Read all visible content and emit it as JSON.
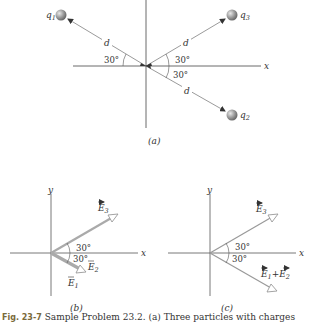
{
  "figure": {
    "panel_a": {
      "label": "(a)",
      "axis_x": "x",
      "charges": [
        {
          "name": "q",
          "sub": "1"
        },
        {
          "name": "q",
          "sub": "2"
        },
        {
          "name": "q",
          "sub": "3"
        }
      ],
      "distance_label": "d",
      "angles": [
        "30°",
        "30°",
        "30°"
      ]
    },
    "panel_b": {
      "label": "(b)",
      "axis_x": "x",
      "axis_y": "y",
      "vectors": [
        {
          "name": "E",
          "sub": "3"
        },
        {
          "name": "E",
          "sub": "2"
        },
        {
          "name": "E",
          "sub": "1"
        }
      ],
      "angles": [
        "30°",
        "30°"
      ]
    },
    "panel_c": {
      "label": "(c)",
      "axis_x": "x",
      "axis_y": "y",
      "vectors": [
        {
          "name": "E",
          "sub": "3"
        },
        {
          "name": "E",
          "sub": "1",
          "plus": "+",
          "name2": "E",
          "sub2": "2"
        }
      ],
      "angles": [
        "30°",
        "30°"
      ]
    },
    "caption": {
      "fig_label": "Fig. 23-7",
      "text": "Sample Problem 23.2. (a) Three particles with charges"
    }
  }
}
